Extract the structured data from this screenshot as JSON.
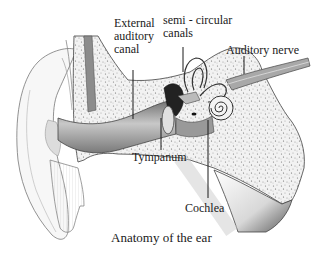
{
  "diagram": {
    "title": "Anatomy of the ear",
    "labels": {
      "external_auditory_canal": [
        "External",
        "auditory",
        "canal"
      ],
      "semicircular_canals": [
        "semi - circular",
        "canals"
      ],
      "auditory_nerve": "Auditory nerve",
      "tympanum": "Tympanum",
      "cochlea": "Cochlea"
    },
    "colors": {
      "line": "#1a1a1a",
      "outline": "#555555",
      "bone_fill": "#e9e9e9",
      "canal_shadow": "#8a8a8a",
      "nerve": "#9a9a9a"
    }
  }
}
